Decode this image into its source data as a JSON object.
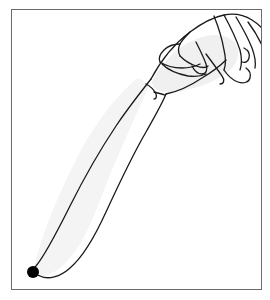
{
  "figure": {
    "frame": {
      "name": "figure-border",
      "x": 11,
      "y": 9,
      "width": 251,
      "height": 281,
      "border_color": "#6b6b6b",
      "border_width": 1,
      "background": "#ffffff"
    },
    "style": {
      "stroke_color": "#1a1a1a",
      "stroke_width": 1.3,
      "limb_fill": "#f4f4f4",
      "hand_fill": "#f0f0f0",
      "marker_color": "#000000",
      "canvas_background": "#ffffff"
    },
    "marker": {
      "name": "fingertip-marker-dot",
      "label": "",
      "cx": 33,
      "cy": 272,
      "r": 6,
      "color": "#000000"
    },
    "parts": [
      {
        "name": "forearm-outline",
        "label": "forearm"
      },
      {
        "name": "wrist-crease",
        "label": "wrist"
      },
      {
        "name": "hand-outline",
        "label": "hand"
      },
      {
        "name": "index-finger",
        "label": "index finger"
      },
      {
        "name": "middle-finger",
        "label": "middle finger"
      },
      {
        "name": "ring-finger",
        "label": "ring finger"
      },
      {
        "name": "little-finger",
        "label": "little finger"
      },
      {
        "name": "thumb",
        "label": "thumb"
      }
    ]
  }
}
